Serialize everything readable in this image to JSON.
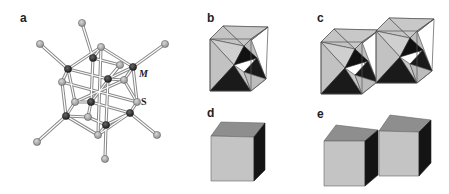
{
  "figure": {
    "panels": [
      {
        "id": "a",
        "label": "a",
        "content": "metal-sulfide cluster ball-and-stick structure"
      },
      {
        "id": "b",
        "label": "b",
        "content": "stellated octahedron inside cube"
      },
      {
        "id": "c",
        "label": "c",
        "content": "two linked stellated octahedra inside cubes"
      },
      {
        "id": "d",
        "label": "d",
        "content": "single shaded cube"
      },
      {
        "id": "e",
        "label": "e",
        "content": "two corner-linked shaded cubes"
      }
    ],
    "atom_labels": {
      "metal": "M",
      "sulfur": "S"
    },
    "colors": {
      "metal_atom": "#2a2a2a",
      "sulfur_atom": "#a8a8a8",
      "bond": "#7a7a7a",
      "light_face": "#c4c4c4",
      "mid_face": "#8e8e8e",
      "dark_face": "#141414",
      "edge": "#555555"
    }
  }
}
